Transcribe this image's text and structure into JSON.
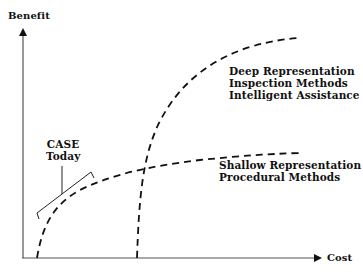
{
  "axes": {
    "y_label": "Benefit",
    "x_label": "Cost"
  },
  "curves": [
    {
      "name": "deep",
      "lines": [
        "Deep Representation",
        "Inspection Methods",
        "Intelligent Assistance"
      ],
      "style": "dashed"
    },
    {
      "name": "shallow",
      "lines": [
        "Shallow Representation",
        "Procedural Methods"
      ],
      "style": "dashed"
    }
  ],
  "annotation": {
    "lines": [
      "CASE",
      "Today"
    ]
  },
  "colors": {
    "axis": "#555555",
    "curve": "#111111",
    "background": "#ffffff"
  }
}
